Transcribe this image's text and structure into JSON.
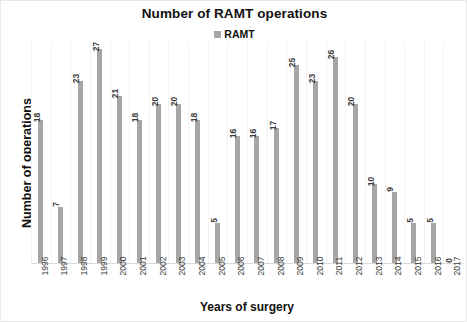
{
  "chart_data": {
    "type": "bar",
    "title": "Number of RAMT operations",
    "xlabel": "Years of surgery",
    "ylabel": "Number of operations",
    "ylim": [
      0,
      28
    ],
    "grid": true,
    "legend_position": "top-center",
    "legend": [
      "RAMT"
    ],
    "series_color": "#a6a6a6",
    "categories": [
      "1996",
      "1997",
      "1998",
      "1999",
      "2000",
      "2001",
      "2002",
      "2003",
      "2004",
      "2005",
      "2006",
      "2007",
      "2008",
      "2009",
      "2010",
      "2011",
      "2012",
      "2013",
      "2014",
      "2015",
      "2016",
      "2017"
    ],
    "series": [
      {
        "name": "RAMT",
        "values": [
          18,
          7,
          23,
          27,
          21,
          18,
          20,
          20,
          18,
          5,
          16,
          16,
          17,
          25,
          23,
          26,
          20,
          10,
          9,
          5,
          5,
          0
        ]
      }
    ]
  }
}
